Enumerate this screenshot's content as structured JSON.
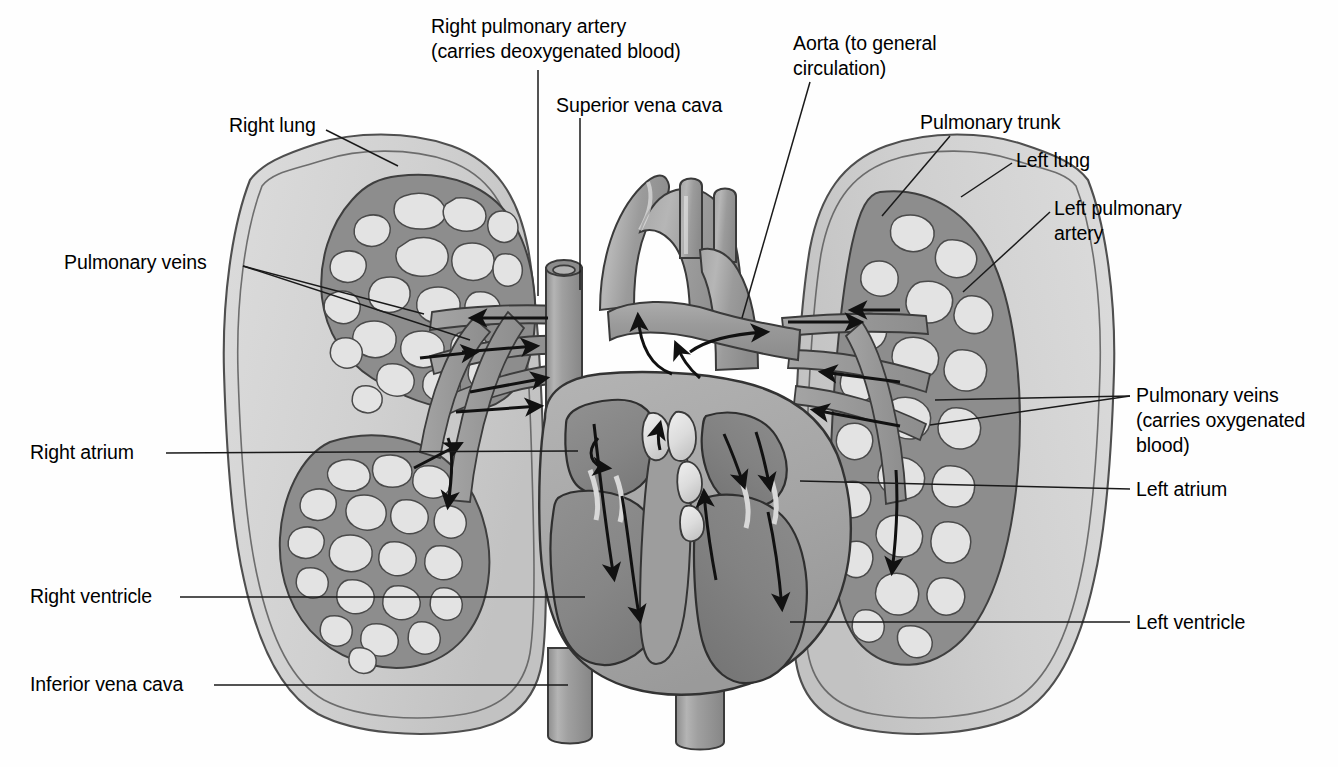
{
  "figure": {
    "type": "anatomical-diagram",
    "background_color": "#fefefe",
    "ink_color": "#000000"
  },
  "palette": {
    "lung_fill": "#d2d2d2",
    "lung_fill_inner": "#c9c9c9",
    "lung_outline": "#4a4a4a",
    "vessel_fill": "#9a9a9a",
    "vessel_dark": "#8a8a8a",
    "heart_wall": "#a8a8a8",
    "chamber_fill": "#8d8d8d",
    "chamber_dark": "#7e7e7e",
    "capillary_mesh": "#8f8f8f",
    "capillary_hole": "#e2e2e2",
    "valve_cusp": "#e8e8e8",
    "leader_line": "#1a1a1a",
    "arrow": "#111111"
  },
  "labels": [
    {
      "id": "right-pulmonary-artery",
      "lines": [
        "Right pulmonary artery",
        "(carries deoxygenated blood)"
      ],
      "align": "left",
      "x": 431,
      "y": 14,
      "leader": [
        [
          538,
          70
        ],
        [
          538,
          296
        ]
      ]
    },
    {
      "id": "superior-vena-cava",
      "lines": [
        "Superior vena cava"
      ],
      "align": "left",
      "x": 556,
      "y": 93,
      "leader": [
        [
          580,
          118
        ],
        [
          580,
          290
        ]
      ]
    },
    {
      "id": "aorta",
      "lines": [
        "Aorta (to general",
        "circulation)"
      ],
      "align": "left",
      "x": 793,
      "y": 31,
      "leader": [
        [
          810,
          82
        ],
        [
          742,
          318
        ]
      ]
    },
    {
      "id": "pulmonary-trunk",
      "lines": [
        "Pulmonary trunk"
      ],
      "align": "left",
      "x": 920,
      "y": 110,
      "leader": [
        [
          950,
          136
        ],
        [
          882,
          216
        ]
      ]
    },
    {
      "id": "left-lung",
      "lines": [
        "Left lung"
      ],
      "align": "left",
      "x": 1016,
      "y": 148,
      "leader": [
        [
          1012,
          163
        ],
        [
          961,
          197
        ]
      ]
    },
    {
      "id": "left-pulmonary-artery",
      "lines": [
        "Left pulmonary",
        "artery"
      ],
      "align": "left",
      "x": 1054,
      "y": 196,
      "leader": [
        [
          1050,
          212
        ],
        [
          963,
          292
        ]
      ]
    },
    {
      "id": "right-lung",
      "lines": [
        "Right lung"
      ],
      "align": "left",
      "x": 229,
      "y": 113,
      "leader": [
        [
          326,
          130
        ],
        [
          398,
          166
        ]
      ]
    },
    {
      "id": "pulmonary-veins-left-label",
      "lines": [
        "Pulmonary veins"
      ],
      "align": "left",
      "x": 64,
      "y": 250,
      "leader": [
        [
          243,
          266
        ],
        [
          424,
          314
        ]
      ],
      "leader2": [
        [
          243,
          266
        ],
        [
          470,
          340
        ]
      ]
    },
    {
      "id": "pulmonary-veins-oxygenated",
      "lines": [
        "Pulmonary veins",
        "(carries oxygenated",
        "blood)"
      ],
      "align": "left",
      "x": 1136,
      "y": 383,
      "leader": [
        [
          1130,
          396
        ],
        [
          935,
          400
        ]
      ],
      "leader2": [
        [
          1130,
          396
        ],
        [
          930,
          425
        ]
      ]
    },
    {
      "id": "left-atrium",
      "lines": [
        "Left atrium"
      ],
      "align": "left",
      "x": 1136,
      "y": 477,
      "leader": [
        [
          1130,
          489
        ],
        [
          800,
          481
        ]
      ]
    },
    {
      "id": "right-atrium",
      "lines": [
        "Right atrium"
      ],
      "align": "left",
      "x": 30,
      "y": 440,
      "leader": [
        [
          166,
          453
        ],
        [
          578,
          451
        ]
      ]
    },
    {
      "id": "right-ventricle",
      "lines": [
        "Right ventricle"
      ],
      "align": "left",
      "x": 30,
      "y": 584,
      "leader": [
        [
          180,
          597
        ],
        [
          585,
          597
        ]
      ]
    },
    {
      "id": "left-ventricle",
      "lines": [
        "Left ventricle"
      ],
      "align": "left",
      "x": 1136,
      "y": 610,
      "leader": [
        [
          1130,
          622
        ],
        [
          790,
          622
        ]
      ]
    },
    {
      "id": "inferior-vena-cava",
      "lines": [
        "Inferior vena cava"
      ],
      "align": "left",
      "x": 30,
      "y": 672,
      "leader": [
        [
          214,
          685
        ],
        [
          568,
          685
        ]
      ]
    }
  ],
  "structures": {
    "right_lung": "right lung with upper and lower lobe capillary beds",
    "left_lung": "left lung with single large capillary bed",
    "heart": "cutaway heart showing right atrium, right ventricle, left atrium, left ventricle, semilunar and atrioventricular valves",
    "great_vessels": [
      "aorta with three arch branches",
      "pulmonary trunk",
      "superior vena cava",
      "inferior vena cava",
      "right pulmonary artery",
      "left pulmonary artery",
      "pulmonary veins"
    ],
    "flow_arrows_count": 22
  }
}
